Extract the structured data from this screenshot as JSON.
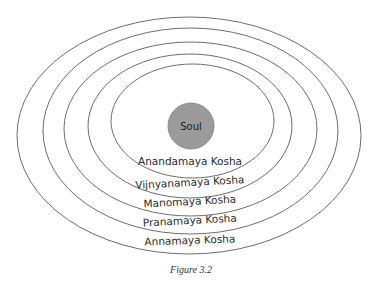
{
  "diagram": {
    "center": {
      "label": "Soul",
      "fill": "#9b9b9b"
    },
    "layers": [
      {
        "label": "Anandamaya Kosha"
      },
      {
        "label": "Vijnyanamaya Kosha"
      },
      {
        "label": "Manomaya Kosha"
      },
      {
        "label": "Pranamaya Kosha"
      },
      {
        "label": "Annamaya Kosha"
      }
    ],
    "caption": "Figure 3.2"
  }
}
